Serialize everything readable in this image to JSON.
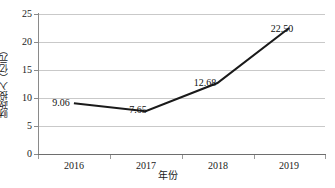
{
  "chart_data": {
    "type": "line",
    "title": "",
    "xlabel": "年份",
    "ylabel": "财政投入（亿元）",
    "categories": [
      "2016",
      "2017",
      "2018",
      "2019"
    ],
    "values": [
      9.06,
      7.65,
      12.68,
      22.5
    ],
    "point_labels": [
      "9.06",
      "7.65",
      "12.68",
      "22.50"
    ],
    "series": [
      {
        "name": "财政投入",
        "values": [
          9.06,
          7.65,
          12.68,
          22.5
        ]
      }
    ],
    "ylim": [
      0,
      25
    ],
    "ytick_values": [
      0,
      5,
      10,
      15,
      20,
      25
    ],
    "ytick_labels": [
      "0",
      "5",
      "10",
      "15",
      "20",
      "25"
    ],
    "grid": "horizontal",
    "legend": "none",
    "line_color": "#1a1a1a",
    "grid_color": "#c9c9c9",
    "axis_color": "#7a7a7a",
    "background": "#ffffff"
  }
}
